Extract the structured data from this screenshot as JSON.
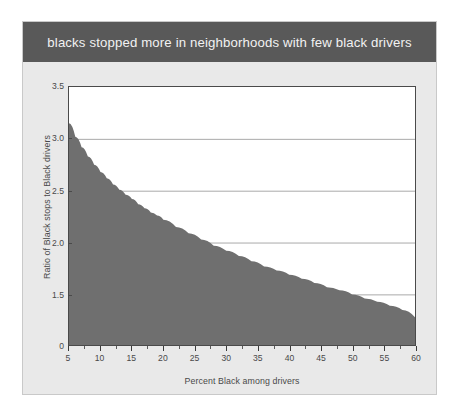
{
  "figure": {
    "background_color": "#e9e9e9",
    "border_color": "#c9c9c9"
  },
  "title": {
    "text": "blacks stopped more in neighborhoods with few black drivers",
    "band_color": "#595959",
    "text_color": "#f2f2f2"
  },
  "chart_data": {
    "type": "area",
    "title": "blacks stopped more in neighborhoods with few black drivers",
    "xlabel": "Percent Black among drivers",
    "ylabel": "Ratio of Black stops to Black drivers",
    "xlim": [
      5,
      60
    ],
    "ylim": [
      1.15,
      3.5
    ],
    "ylim_display_note": "axis baseline labeled 0 (broken axis); linear region spans 1.5-3.5",
    "grid": true,
    "grid_axis": "y",
    "legend": null,
    "fill_color": "#6f6f6f",
    "xticks": [
      5,
      10,
      15,
      20,
      25,
      30,
      35,
      40,
      45,
      50,
      55,
      60
    ],
    "xtick_labels": [
      "5",
      "10",
      "15",
      "20",
      "25",
      "30",
      "35",
      "40",
      "45",
      "50",
      "55",
      "60"
    ],
    "yticks": [
      0,
      1.5,
      2.0,
      2.5,
      3.0,
      3.5
    ],
    "ytick_labels": [
      "0",
      "1.5",
      "2.0",
      "2.5",
      "3.0",
      "3.5"
    ],
    "gridline_values": [
      1.5,
      2.0,
      2.5,
      3.0
    ],
    "x": [
      5,
      6,
      7,
      8,
      9,
      10,
      11,
      12,
      13,
      14,
      15,
      16,
      17,
      18,
      19,
      20,
      22,
      24,
      26,
      28,
      30,
      32,
      34,
      36,
      38,
      40,
      42,
      44,
      46,
      48,
      50,
      52,
      54,
      56,
      58,
      60
    ],
    "values": [
      3.15,
      3.02,
      2.92,
      2.83,
      2.75,
      2.68,
      2.62,
      2.56,
      2.51,
      2.46,
      2.42,
      2.37,
      2.33,
      2.29,
      2.26,
      2.22,
      2.15,
      2.09,
      2.03,
      1.97,
      1.92,
      1.87,
      1.82,
      1.77,
      1.73,
      1.69,
      1.65,
      1.61,
      1.57,
      1.54,
      1.5,
      1.46,
      1.43,
      1.39,
      1.35,
      1.28
    ],
    "series": [
      {
        "name": "Ratio of Black stops to Black drivers",
        "values": [
          3.15,
          3.02,
          2.92,
          2.83,
          2.75,
          2.68,
          2.62,
          2.56,
          2.51,
          2.46,
          2.42,
          2.37,
          2.33,
          2.29,
          2.26,
          2.22,
          2.15,
          2.09,
          2.03,
          1.97,
          1.92,
          1.87,
          1.82,
          1.77,
          1.73,
          1.69,
          1.65,
          1.61,
          1.57,
          1.54,
          1.5,
          1.46,
          1.43,
          1.39,
          1.35,
          1.28
        ]
      }
    ]
  }
}
